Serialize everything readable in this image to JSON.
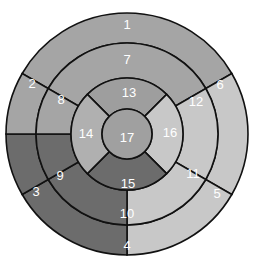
{
  "diagram": {
    "center": [
      127,
      134
    ],
    "radii": [
      121,
      91,
      56,
      25
    ],
    "colors": {
      "dark": "#6e6e6e",
      "medium": "#9c9c9c",
      "medium_alt": "#a9a9a9",
      "light": "#c9c9c9",
      "line": "#111111"
    },
    "rings": [
      {
        "name": "basal",
        "r_outer": 121,
        "r_inner": 91,
        "segments": [
          {
            "id": 1,
            "label": "1",
            "start": 300,
            "end": 60,
            "color": "#a5a5a5"
          },
          {
            "id": 6,
            "label": "6",
            "start": 60,
            "end": 120,
            "color": "#c8c8c8"
          },
          {
            "id": 5,
            "label": "5",
            "start": 120,
            "end": 180,
            "color": "#c8c8c8"
          },
          {
            "id": 4,
            "label": "4",
            "start": 180,
            "end": 240,
            "color": "#6c6c6c"
          },
          {
            "id": 3,
            "label": "3",
            "start": 240,
            "end": 270,
            "color": "#6c6c6c"
          },
          {
            "id": 2,
            "label": "2",
            "start": 270,
            "end": 300,
            "color": "#a5a5a5"
          }
        ]
      },
      {
        "name": "mid",
        "r_outer": 91,
        "r_inner": 56,
        "segments": [
          {
            "id": 7,
            "label": "7",
            "start": 300,
            "end": 60,
            "color": "#a5a5a5"
          },
          {
            "id": 12,
            "label": "12",
            "start": 60,
            "end": 120,
            "color": "#c8c8c8"
          },
          {
            "id": 11,
            "label": "11",
            "start": 120,
            "end": 180,
            "color": "#c8c8c8"
          },
          {
            "id": 10,
            "label": "10",
            "start": 180,
            "end": 240,
            "color": "#6c6c6c"
          },
          {
            "id": 9,
            "label": "9",
            "start": 240,
            "end": 270,
            "color": "#6c6c6c"
          },
          {
            "id": 8,
            "label": "8",
            "start": 270,
            "end": 300,
            "color": "#a5a5a5"
          }
        ]
      },
      {
        "name": "apical",
        "r_outer": 56,
        "r_inner": 25,
        "segments": [
          {
            "id": 13,
            "label": "13",
            "start": 315,
            "end": 45,
            "color": "#9e9e9e"
          },
          {
            "id": 16,
            "label": "16",
            "start": 45,
            "end": 135,
            "color": "#c8c8c8"
          },
          {
            "id": 15,
            "label": "15",
            "start": 135,
            "end": 225,
            "color": "#6c6c6c"
          },
          {
            "id": 14,
            "label": "14",
            "start": 225,
            "end": 315,
            "color": "#b0b0b0"
          }
        ]
      },
      {
        "name": "apex",
        "r_outer": 25,
        "r_inner": 0,
        "segments": [
          {
            "id": 17,
            "label": "17",
            "start": 0,
            "end": 360,
            "color": "#a0a0a0"
          }
        ]
      }
    ],
    "labels": [
      {
        "text": "1",
        "x": 127,
        "y": 24
      },
      {
        "text": "2",
        "x": 32,
        "y": 83
      },
      {
        "text": "3",
        "x": 36,
        "y": 191
      },
      {
        "text": "4",
        "x": 127,
        "y": 245
      },
      {
        "text": "5",
        "x": 217,
        "y": 193
      },
      {
        "text": "6",
        "x": 220,
        "y": 84
      },
      {
        "text": "7",
        "x": 127,
        "y": 59
      },
      {
        "text": "8",
        "x": 61,
        "y": 99
      },
      {
        "text": "9",
        "x": 60,
        "y": 175
      },
      {
        "text": "10",
        "x": 127,
        "y": 213
      },
      {
        "text": "11",
        "x": 193,
        "y": 173
      },
      {
        "text": "12",
        "x": 196,
        "y": 101
      },
      {
        "text": "13",
        "x": 129,
        "y": 92
      },
      {
        "text": "14",
        "x": 86,
        "y": 133
      },
      {
        "text": "15",
        "x": 128,
        "y": 183
      },
      {
        "text": "16",
        "x": 170,
        "y": 132
      },
      {
        "text": "17",
        "x": 127,
        "y": 137
      }
    ]
  }
}
